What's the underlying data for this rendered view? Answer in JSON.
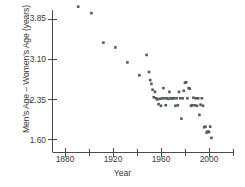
{
  "chart_data": {
    "type": "scatter",
    "title": "",
    "xlabel": "Year",
    "ylabel": "Men's Age – Women's Age (years)",
    "xlim": [
      1865,
      2020
    ],
    "ylim": [
      1.45,
      4.25
    ],
    "grid": false,
    "legend": null,
    "xticks": [
      1880,
      1920,
      1960,
      2000
    ],
    "xtick_labels": [
      "1880",
      "1920",
      "1960",
      "2000"
    ],
    "xminor_ticks": [
      1900,
      1940,
      1980,
      2020
    ],
    "yticks": [
      1.6,
      2.35,
      3.1,
      3.85
    ],
    "ytick_labels": [
      "1.60",
      "2.35",
      "3.10",
      "3.85"
    ],
    "marker": {
      "shape": "square",
      "size_px": 2.6,
      "color": "#555a5e"
    },
    "points": [
      [
        1891,
        4.07
      ],
      [
        1902,
        3.95
      ],
      [
        1912,
        3.4
      ],
      [
        1922,
        3.31
      ],
      [
        1932,
        3.03
      ],
      [
        1942,
        2.79
      ],
      [
        1948,
        3.17
      ],
      [
        1950,
        2.85
      ],
      [
        1951,
        2.7
      ],
      [
        1952,
        2.63
      ],
      [
        1953,
        2.52
      ],
      [
        1954,
        2.38
      ],
      [
        1955,
        2.48
      ],
      [
        1956,
        2.36
      ],
      [
        1957,
        2.34
      ],
      [
        1958,
        2.25
      ],
      [
        1959,
        2.35
      ],
      [
        1960,
        2.22
      ],
      [
        1961,
        2.36
      ],
      [
        1962,
        2.55
      ],
      [
        1963,
        2.36
      ],
      [
        1964,
        2.23
      ],
      [
        1965,
        2.36
      ],
      [
        1966,
        2.35
      ],
      [
        1967,
        2.48
      ],
      [
        1968,
        2.36
      ],
      [
        1969,
        2.36
      ],
      [
        1970,
        2.36
      ],
      [
        1971,
        2.36
      ],
      [
        1972,
        2.22
      ],
      [
        1973,
        2.36
      ],
      [
        1974,
        2.23
      ],
      [
        1975,
        2.48
      ],
      [
        1976,
        2.36
      ],
      [
        1977,
        1.98
      ],
      [
        1978,
        2.36
      ],
      [
        1979,
        2.5
      ],
      [
        1980,
        2.65
      ],
      [
        1981,
        2.66
      ],
      [
        1982,
        2.36
      ],
      [
        1983,
        2.55
      ],
      [
        1984,
        2.54
      ],
      [
        1985,
        2.22
      ],
      [
        1986,
        2.23
      ],
      [
        1987,
        2.37
      ],
      [
        1988,
        2.23
      ],
      [
        1989,
        2.36
      ],
      [
        1990,
        2.22
      ],
      [
        1991,
        2.36
      ],
      [
        1992,
        2.05
      ],
      [
        1993,
        2.24
      ],
      [
        1994,
        2.36
      ],
      [
        1995,
        2.22
      ],
      [
        1996,
        1.82
      ],
      [
        1997,
        1.83
      ],
      [
        1998,
        1.72
      ],
      [
        1999,
        1.74
      ],
      [
        2000,
        1.73
      ],
      [
        2001,
        1.83
      ],
      [
        2002,
        1.62
      ]
    ]
  },
  "axes": {
    "y_title": "Men's Age – Women's Age (years)",
    "x_title": "Year",
    "y_labels": [
      "3.85",
      "3.10",
      "2.35",
      "1.60"
    ],
    "x_labels": [
      "1880",
      "1920",
      "1960",
      "2000"
    ]
  }
}
